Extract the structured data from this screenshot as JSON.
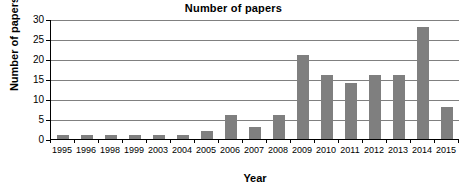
{
  "chart_data": {
    "type": "bar",
    "title": "Number of papers",
    "xlabel": "Year",
    "ylabel": "Number of papers",
    "categories": [
      "1995",
      "1996",
      "1998",
      "1999",
      "2003",
      "2004",
      "2005",
      "2006",
      "2007",
      "2008",
      "2009",
      "2010",
      "2011",
      "2012",
      "2013",
      "2014",
      "2015"
    ],
    "values": [
      1,
      1,
      1,
      1,
      1,
      1,
      2,
      6,
      3,
      6,
      21,
      16,
      14,
      16,
      16,
      28,
      8
    ],
    "ylim": [
      0,
      30
    ],
    "yticks": [
      0,
      5,
      10,
      15,
      20,
      25,
      30
    ],
    "ytick_labels": [
      "0",
      "5",
      "10",
      "15",
      "20",
      "25",
      "30"
    ],
    "grid": true,
    "legend": false,
    "bar_color": "#7f7f7f",
    "axis_color": "#000000",
    "gridline_color": "#808080",
    "background": "#ffffff"
  }
}
